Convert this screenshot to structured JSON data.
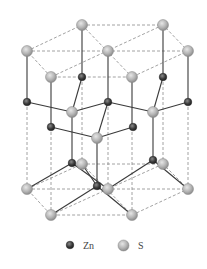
{
  "diagram": {
    "colors": {
      "zn": "#3a3a3a",
      "s": "#b8b8b8",
      "bond": "#3a3a3a",
      "cell": "#8a8a8a"
    },
    "atoms": [
      {
        "el": "S",
        "x": 82,
        "y": 25
      },
      {
        "el": "S",
        "x": 163,
        "y": 25
      },
      {
        "el": "S",
        "x": 27,
        "y": 51
      },
      {
        "el": "S",
        "x": 108,
        "y": 51
      },
      {
        "el": "S",
        "x": 188,
        "y": 51
      },
      {
        "el": "S",
        "x": 51,
        "y": 77
      },
      {
        "el": "S",
        "x": 132,
        "y": 77
      },
      {
        "el": "Zn",
        "x": 82,
        "y": 77
      },
      {
        "el": "Zn",
        "x": 163,
        "y": 77
      },
      {
        "el": "Zn",
        "x": 27,
        "y": 102
      },
      {
        "el": "Zn",
        "x": 108,
        "y": 102
      },
      {
        "el": "Zn",
        "x": 188,
        "y": 102
      },
      {
        "el": "S",
        "x": 72,
        "y": 112
      },
      {
        "el": "S",
        "x": 153,
        "y": 112
      },
      {
        "el": "Zn",
        "x": 51,
        "y": 127
      },
      {
        "el": "Zn",
        "x": 133,
        "y": 127
      },
      {
        "el": "S",
        "x": 97,
        "y": 138
      },
      {
        "el": "Zn",
        "x": 72,
        "y": 163
      },
      {
        "el": "Zn",
        "x": 153,
        "y": 160
      },
      {
        "el": "S",
        "x": 82,
        "y": 164
      },
      {
        "el": "S",
        "x": 163,
        "y": 164
      },
      {
        "el": "Zn",
        "x": 97,
        "y": 186
      },
      {
        "el": "S",
        "x": 27,
        "y": 189
      },
      {
        "el": "S",
        "x": 108,
        "y": 189
      },
      {
        "el": "S",
        "x": 188,
        "y": 189
      },
      {
        "el": "S",
        "x": 51,
        "y": 215
      },
      {
        "el": "S",
        "x": 132,
        "y": 215
      }
    ]
  },
  "legend": {
    "items": [
      {
        "symbol": "Zn",
        "label": "Zn"
      },
      {
        "symbol": "S",
        "label": "S"
      }
    ]
  }
}
